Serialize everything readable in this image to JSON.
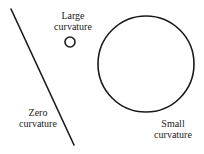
{
  "diagram": {
    "shapes": [
      {
        "id": "straight-line",
        "type": "line",
        "x1": 11,
        "y1": 9,
        "x2": 74,
        "y2": 145
      },
      {
        "id": "small-circle",
        "type": "circle",
        "cx": 70,
        "cy": 42,
        "r": 5
      },
      {
        "id": "large-circle",
        "type": "circle",
        "cx": 146,
        "cy": 64,
        "r": 48
      }
    ],
    "stroke_color": "#1a1a1a"
  },
  "labels": {
    "large": {
      "line1": "Large",
      "line2": "curvature"
    },
    "zero": {
      "line1": "Zero",
      "line2": "curvature"
    },
    "small": {
      "line1": "Small",
      "line2": "curvature"
    }
  }
}
